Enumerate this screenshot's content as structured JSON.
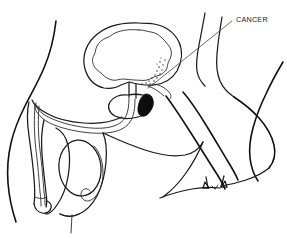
{
  "figure": {
    "style": "black-and-white line drawing",
    "background_color": "#ffffff",
    "line_color": "#1a1a1a",
    "width": 287,
    "height": 239
  },
  "annotations": [
    {
      "id": "cancer",
      "label": "CANCER",
      "label_x": 236,
      "label_y": 19,
      "leader_from_x": 232,
      "leader_from_y": 21,
      "leader_to_x": 156,
      "leader_to_y": 82,
      "points_to": "tumor-mass",
      "color": "#1a1a1a"
    }
  ],
  "structures": [
    {
      "id": "abdominal-wall",
      "name": "Abdominal wall contour",
      "interactable": false
    },
    {
      "id": "bladder-outer-wall",
      "name": "Urinary bladder outer wall",
      "interactable": false
    },
    {
      "id": "bladder-inner-lining",
      "name": "Urinary bladder mucosal lining",
      "interactable": false
    },
    {
      "id": "prostate-gland",
      "name": "Prostate gland",
      "interactable": false
    },
    {
      "id": "tumor-mass",
      "name": "Cancer tumor mass",
      "fill": "#0d0d0d",
      "interactable": false
    },
    {
      "id": "seminal-vesicle",
      "name": "Seminal vesicle",
      "interactable": false
    },
    {
      "id": "urethra",
      "name": "Urethra",
      "interactable": false
    },
    {
      "id": "penis-shaft",
      "name": "Penis shaft",
      "interactable": false
    },
    {
      "id": "glans-penis",
      "name": "Glans penis",
      "interactable": false
    },
    {
      "id": "testicle",
      "name": "Testicle",
      "interactable": false
    },
    {
      "id": "epididymis",
      "name": "Epididymis",
      "interactable": false
    },
    {
      "id": "scrotum",
      "name": "Scrotum",
      "interactable": false
    },
    {
      "id": "rectum",
      "name": "Rectum",
      "interactable": false
    },
    {
      "id": "buttock",
      "name": "Buttock contour",
      "interactable": false
    },
    {
      "id": "anus",
      "name": "Anus",
      "interactable": false
    },
    {
      "id": "pelvic-floor",
      "name": "Pelvic floor",
      "interactable": false
    }
  ]
}
